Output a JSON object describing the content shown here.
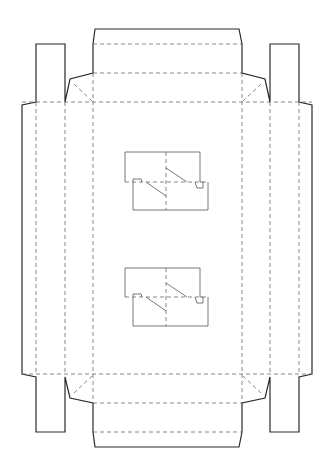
{
  "diagram": {
    "title": "Box die-cut template",
    "type": "packaging dieline",
    "colors": {
      "cut_line": "#2a2a2a",
      "fold_line": "#6a6a6a",
      "background": "#ffffff"
    },
    "legend": {
      "solid": "cut line",
      "dashed": "fold line"
    },
    "parts": [
      "top flap",
      "top dust panel",
      "left side tab",
      "right side tab",
      "left wall",
      "right wall",
      "base panel",
      "upper insert cutout",
      "lower insert cutout",
      "bottom dust panel",
      "bottom flap"
    ]
  }
}
